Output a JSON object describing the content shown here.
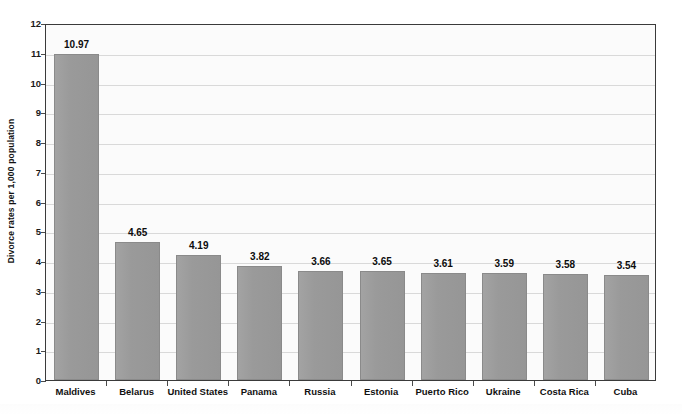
{
  "chart_data": {
    "type": "bar",
    "title": "",
    "subtitle": "",
    "xlabel": "",
    "ylabel": "Divorce rates per 1,000 population",
    "ylim": [
      0,
      12
    ],
    "ytick_labels": [
      "0",
      "1",
      "2",
      "3",
      "4",
      "5",
      "6",
      "7",
      "8",
      "9",
      "10",
      "11",
      "12"
    ],
    "ytick_values": [
      0,
      1,
      2,
      3,
      4,
      5,
      6,
      7,
      8,
      9,
      10,
      11,
      12
    ],
    "grid": true,
    "grid_axis": "y",
    "legend": false,
    "legend_position": "none",
    "bar_color": "#9a9a9a",
    "bar_edge_color": "#8a8a8a",
    "plot_background": "#fbfbfb",
    "gridline_color": "#d9d9d9",
    "axis_color": "#3a3a3a",
    "value_label_color": "#0d0d0d",
    "categories": [
      "Maldives",
      "Belarus",
      "United States",
      "Panama",
      "Russia",
      "Estonia",
      "Puerto Rico",
      "Ukraine",
      "Costa Rica",
      "Cuba"
    ],
    "values": [
      10.97,
      4.65,
      4.19,
      3.82,
      3.66,
      3.65,
      3.61,
      3.59,
      3.58,
      3.54
    ],
    "value_labels": [
      "10.97",
      "4.65",
      "4.19",
      "3.82",
      "3.66",
      "3.65",
      "3.61",
      "3.59",
      "3.58",
      "3.54"
    ]
  }
}
